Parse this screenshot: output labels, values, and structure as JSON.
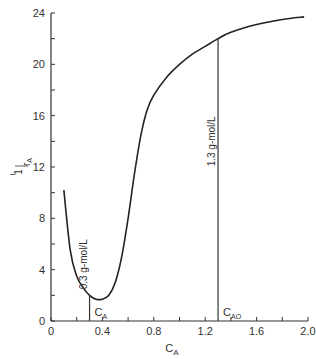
{
  "chart_data": {
    "type": "line",
    "title": "",
    "xlabel": "C_A",
    "ylabel": "-1/r_A",
    "xlim": [
      0,
      2.0
    ],
    "ylim": [
      0,
      24
    ],
    "x_ticks": [
      "0",
      "0.4",
      "0.8",
      "1.2",
      "1.6",
      "2.0"
    ],
    "y_ticks": [
      "0",
      "4",
      "8",
      "12",
      "16",
      "20",
      "24"
    ],
    "grid": false,
    "series": [
      {
        "name": "-1/r_A vs C_A",
        "x": [
          0.1,
          0.15,
          0.2,
          0.25,
          0.3,
          0.35,
          0.4,
          0.45,
          0.5,
          0.55,
          0.6,
          0.65,
          0.7,
          0.75,
          0.8,
          0.9,
          1.0,
          1.1,
          1.2,
          1.3,
          1.4,
          1.6,
          1.8,
          1.97
        ],
        "y": [
          10.2,
          5.5,
          3.5,
          2.6,
          2.0,
          1.7,
          1.7,
          2.0,
          3.0,
          5.0,
          8.0,
          11.5,
          14.5,
          16.5,
          17.6,
          19.0,
          20.0,
          20.8,
          21.4,
          22.0,
          22.5,
          23.1,
          23.5,
          23.7
        ]
      }
    ],
    "annotations": [
      {
        "x": 0.3,
        "y_top": 2.0,
        "label": "0.3 g-mol/L",
        "sub_label": "C_A"
      },
      {
        "x": 1.3,
        "y_top": 22.0,
        "label": "1.3 g-mol/L",
        "sub_label": "C_AO"
      }
    ]
  },
  "labels": {
    "xlabel_main": "C",
    "xlabel_sub": "A",
    "ylabel_num": "1",
    "ylabel_den": "r",
    "ylabel_den_sub": "A",
    "ylabel_minus": "−",
    "ann1_text": "0.3 g-mol/L",
    "ann1_sub_main": "C",
    "ann1_sub_sub": "A",
    "ann2_text": "1.3 g-mol/L",
    "ann2_sub_main": "C",
    "ann2_sub_sub": "AO"
  }
}
